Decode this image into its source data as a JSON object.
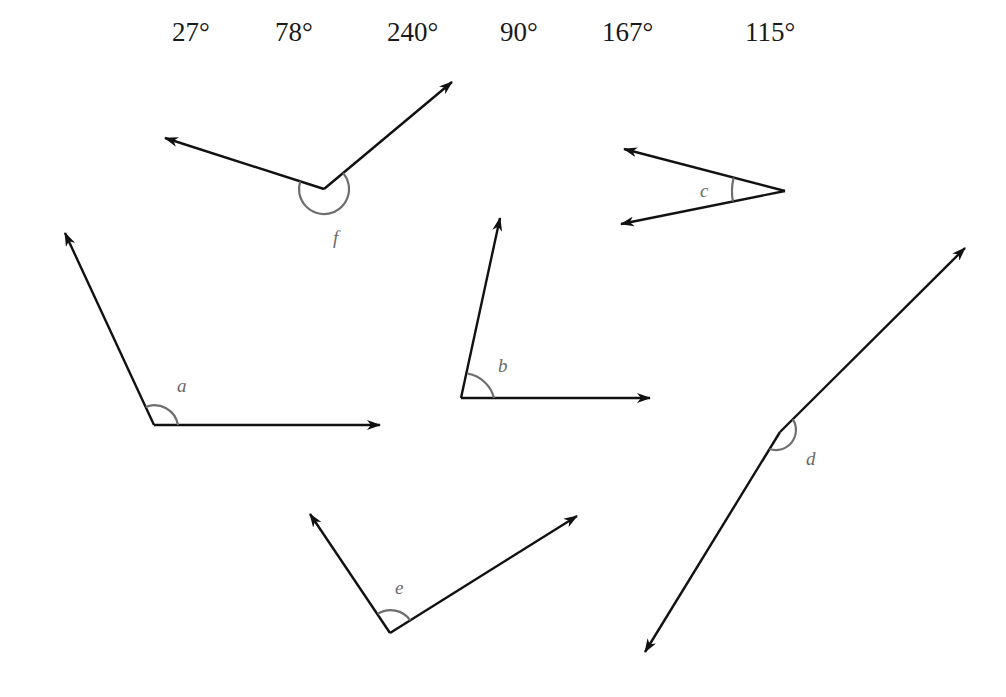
{
  "degree_options": [
    {
      "label": "27°",
      "x": 172
    },
    {
      "label": "78°",
      "x": 275
    },
    {
      "label": "240°",
      "x": 387
    },
    {
      "label": "90°",
      "x": 500
    },
    {
      "label": "167°",
      "x": 602
    },
    {
      "label": "115°",
      "x": 745
    }
  ],
  "angles": [
    {
      "name": "a",
      "label": "a"
    },
    {
      "name": "b",
      "label": "b"
    },
    {
      "name": "c",
      "label": "c"
    },
    {
      "name": "d",
      "label": "d"
    },
    {
      "name": "e",
      "label": "e"
    },
    {
      "name": "f",
      "label": "f"
    }
  ],
  "colors": {
    "line": "#111111",
    "arc": "#6e6e6e",
    "label": "#6a6a6a"
  }
}
